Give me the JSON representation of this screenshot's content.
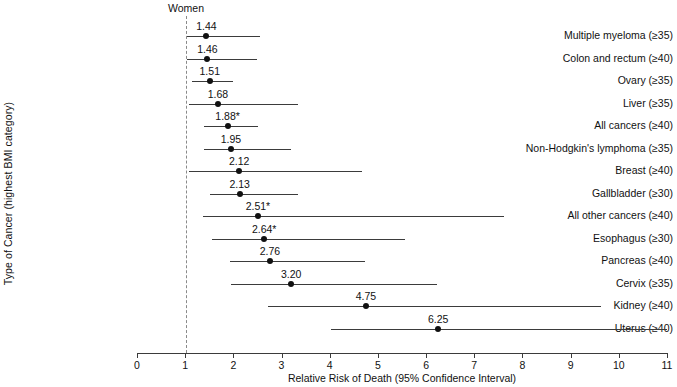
{
  "chart_data": {
    "type": "scatter",
    "subtype": "forest-plot",
    "title": "Women",
    "xlabel": "Relative Risk of Death (95% Confidence Interval)",
    "ylabel": "Type of Cancer (highest BMI category)",
    "xlim": [
      0,
      11
    ],
    "xticks": [
      0,
      1,
      2,
      3,
      4,
      5,
      6,
      7,
      8,
      9,
      10,
      11
    ],
    "xticklabels": [
      "0",
      "1",
      "2",
      "3",
      "4",
      "5",
      "6",
      "7",
      "8",
      "9",
      "10",
      "11"
    ],
    "reference_line": 1,
    "grid": false,
    "legend": "none",
    "marker_color": "#111111",
    "line_color": "#3b3b3b",
    "footnote_symbol": "*",
    "categories": [
      "Multiple myeloma (≥35)",
      "Colon and rectum (≥40)",
      "Ovary (≥35)",
      "Liver (≥35)",
      "All cancers (≥40)",
      "Non-Hodgkin's lymphoma (≥35)",
      "Breast (≥40)",
      "Gallbladder (≥30)",
      "All other cancers (≥40)",
      "Esophagus (≥30)",
      "Pancreas (≥40)",
      "Cervix (≥35)",
      "Kidney (≥40)",
      "Uterus (≥40)"
    ],
    "values": [
      1.44,
      1.46,
      1.51,
      1.68,
      1.88,
      1.95,
      2.12,
      2.13,
      2.51,
      2.64,
      2.76,
      3.2,
      4.75,
      6.25
    ],
    "value_labels": [
      "1.44",
      "1.46",
      "1.51",
      "1.68",
      "1.88*",
      "1.95",
      "2.12",
      "2.13",
      "2.51*",
      "2.64*",
      "2.76",
      "3.20",
      "4.75",
      "6.25"
    ],
    "ci_low": [
      1.03,
      1.04,
      1.14,
      1.07,
      1.4,
      1.39,
      1.08,
      1.51,
      1.37,
      1.56,
      1.92,
      1.96,
      2.72,
      4.02
    ],
    "ci_high": [
      2.55,
      2.5,
      2.0,
      3.35,
      2.52,
      3.2,
      4.66,
      3.34,
      7.61,
      5.57,
      4.73,
      6.23,
      9.62,
      11.0
    ],
    "rows": [
      {
        "label": "Multiple myeloma (≥35)",
        "value": 1.44,
        "value_label": "1.44",
        "low": 1.03,
        "high": 2.55
      },
      {
        "label": "Colon and rectum (≥40)",
        "value": 1.46,
        "value_label": "1.46",
        "low": 1.04,
        "high": 2.5
      },
      {
        "label": "Ovary (≥35)",
        "value": 1.51,
        "value_label": "1.51",
        "low": 1.14,
        "high": 2.0
      },
      {
        "label": "Liver (≥35)",
        "value": 1.68,
        "value_label": "1.68",
        "low": 1.07,
        "high": 3.35
      },
      {
        "label": "All cancers (≥40)",
        "value": 1.88,
        "value_label": "1.88*",
        "low": 1.4,
        "high": 2.52
      },
      {
        "label": "Non-Hodgkin's lymphoma (≥35)",
        "value": 1.95,
        "value_label": "1.95",
        "low": 1.39,
        "high": 3.2
      },
      {
        "label": "Breast (≥40)",
        "value": 2.12,
        "value_label": "2.12",
        "low": 1.08,
        "high": 4.66
      },
      {
        "label": "Gallbladder (≥30)",
        "value": 2.13,
        "value_label": "2.13",
        "low": 1.51,
        "high": 3.34
      },
      {
        "label": "All other cancers (≥40)",
        "value": 2.51,
        "value_label": "2.51*",
        "low": 1.37,
        "high": 7.61
      },
      {
        "label": "Esophagus (≥30)",
        "value": 2.64,
        "value_label": "2.64*",
        "low": 1.56,
        "high": 5.57
      },
      {
        "label": "Pancreas (≥40)",
        "value": 2.76,
        "value_label": "2.76",
        "low": 1.92,
        "high": 4.73
      },
      {
        "label": "Cervix (≥35)",
        "value": 3.2,
        "value_label": "3.20",
        "low": 1.96,
        "high": 6.23
      },
      {
        "label": "Kidney (≥40)",
        "value": 4.75,
        "value_label": "4.75",
        "low": 2.72,
        "high": 9.62
      },
      {
        "label": "Uterus (≥40)",
        "value": 6.25,
        "value_label": "6.25",
        "low": 4.02,
        "high": 11.0
      }
    ]
  }
}
